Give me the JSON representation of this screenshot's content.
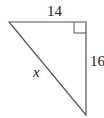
{
  "diagram": {
    "type": "right-triangle",
    "labels": {
      "top_side": "14",
      "right_side": "16",
      "hypotenuse": "x"
    },
    "right_angle_at": "top-right",
    "stroke_color": "#555555"
  }
}
